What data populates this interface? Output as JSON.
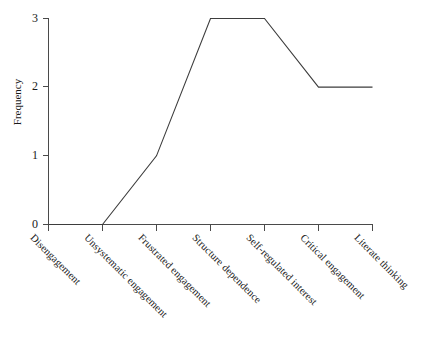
{
  "chart_data": {
    "type": "line",
    "title": "",
    "xlabel": "",
    "ylabel": "Frequency",
    "ylim": [
      0,
      3
    ],
    "yticks": [
      0,
      1,
      2,
      3
    ],
    "ytick_labels": [
      "0",
      "1",
      "2",
      "3"
    ],
    "grid": false,
    "legend": null,
    "markers": false,
    "line_color": "#3d3d3d",
    "categories": [
      "Disengagement",
      "Unsystematic engagement",
      "Frustrated engagement",
      "Structure dependence",
      "Self-regulated interest",
      "Critical engagement",
      "Literate thinking"
    ],
    "values": [
      0,
      0,
      1,
      3,
      3,
      2,
      2
    ],
    "points": [
      {
        "category": "Disengagement",
        "value": 0
      },
      {
        "category": "Unsystematic engagement",
        "value": 0
      },
      {
        "category": "Frustrated engagement",
        "value": 1
      },
      {
        "category": "Structure dependence",
        "value": 3
      },
      {
        "category": "Self-regulated interest",
        "value": 3
      },
      {
        "category": "Critical engagement",
        "value": 2
      },
      {
        "category": "Literate thinking",
        "value": 2
      }
    ]
  },
  "axes": {
    "y_title": "Frequency",
    "y_tick_0": "0",
    "y_tick_1": "1",
    "y_tick_2": "2",
    "y_tick_3": "3"
  },
  "x_labels": {
    "c0": "Disengagement",
    "c1": "Unsystematic engagement",
    "c2": "Frustrated engagement",
    "c3": "Structure dependence",
    "c4": "Self-regulated interest",
    "c5": "Critical engagement",
    "c6": "Literate thinking"
  },
  "title_sliver": ""
}
